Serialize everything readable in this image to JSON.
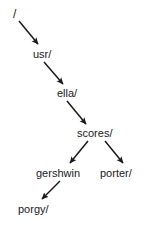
{
  "diagram": {
    "type": "directory-tree",
    "background_color": "#ffffff",
    "text_color": "#1a1a1a",
    "arrow_color": "#1a1a1a",
    "nodes": [
      {
        "id": "root",
        "label": "/",
        "x": 13,
        "y": 8,
        "depth": 0
      },
      {
        "id": "usr",
        "label": "usr/",
        "x": 33,
        "y": 48,
        "depth": 1
      },
      {
        "id": "ella",
        "label": "ella/",
        "x": 57,
        "y": 87,
        "depth": 2
      },
      {
        "id": "scores",
        "label": "scores/",
        "x": 77,
        "y": 127,
        "depth": 3
      },
      {
        "id": "gershwin",
        "label": "gershwin",
        "x": 36,
        "y": 167,
        "depth": 4
      },
      {
        "id": "porter",
        "label": "porter/",
        "x": 100,
        "y": 167,
        "depth": 4
      },
      {
        "id": "porgy",
        "label": "porgy/",
        "x": 18,
        "y": 203,
        "depth": 5
      }
    ],
    "edges": [
      {
        "id": "root-usr",
        "from": "root",
        "to": "usr",
        "x1": 19,
        "y1": 21,
        "x2": 38,
        "y2": 44
      },
      {
        "id": "usr-ella",
        "from": "usr",
        "to": "ella",
        "x1": 44,
        "y1": 62,
        "x2": 63,
        "y2": 84
      },
      {
        "id": "ella-scores",
        "from": "ella",
        "to": "scores",
        "x1": 67,
        "y1": 101,
        "x2": 86,
        "y2": 124
      },
      {
        "id": "scores-gershwin",
        "from": "scores",
        "to": "gershwin",
        "x1": 88,
        "y1": 141,
        "x2": 70,
        "y2": 163
      },
      {
        "id": "scores-porter",
        "from": "scores",
        "to": "porter",
        "x1": 105,
        "y1": 141,
        "x2": 123,
        "y2": 163
      },
      {
        "id": "gershwin-porgy",
        "from": "gershwin",
        "to": "porgy",
        "x1": 60,
        "y1": 181,
        "x2": 42,
        "y2": 199
      }
    ]
  }
}
